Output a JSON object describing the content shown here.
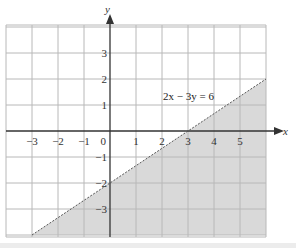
{
  "chart_data": {
    "type": "line",
    "title": "",
    "xlabel": "x",
    "ylabel": "y",
    "xlim": [
      -4,
      6
    ],
    "ylim": [
      -4,
      4
    ],
    "grid": true,
    "x_ticks": [
      -3,
      -2,
      -1,
      0,
      1,
      2,
      3,
      4,
      5
    ],
    "x_tick_labels": [
      "−3",
      "−2",
      "−1",
      "0",
      "1",
      "2",
      "3",
      "4",
      "5"
    ],
    "y_ticks": [
      3,
      2,
      1,
      -1,
      -2,
      -3
    ],
    "y_tick_labels": [
      "3",
      "2",
      "1",
      "−1",
      "−2",
      "−3"
    ],
    "series": [
      {
        "name": "2x − 3y = 6",
        "style": "dashed",
        "x": [
          -3,
          0,
          3,
          6
        ],
        "y": [
          -4,
          -2,
          0,
          2
        ]
      }
    ],
    "shaded_region": {
      "description": "half-plane below the line 2x − 3y = 6 (2x − 3y > 6)",
      "color": "#d9d9d9"
    },
    "annotations": [
      {
        "text": "2x − 3y = 6",
        "x": 2.1,
        "y": 1.3
      }
    ]
  },
  "labels": {
    "equation": "2x − 3y = 6",
    "x_axis": "x",
    "y_axis": "y",
    "origin": "0"
  },
  "colors": {
    "shade": "#d9d9d9",
    "grid": "#b8b8b8",
    "axis": "#333333",
    "line": "#555555"
  }
}
